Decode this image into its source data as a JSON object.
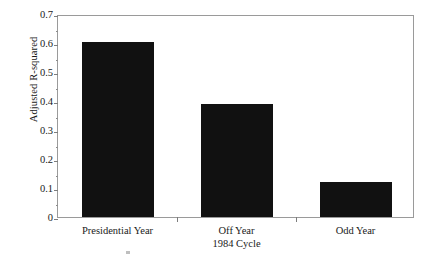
{
  "chart_data": {
    "type": "bar",
    "title": "",
    "subtitle": "",
    "xlabel": "1984 Cycle",
    "ylabel": "Adjusted R-squared",
    "categories": [
      "Presidential Year",
      "Off Year",
      "Odd Year"
    ],
    "category_sublabels": [
      "",
      "1984 Cycle",
      ""
    ],
    "values": [
      0.605,
      0.39,
      0.12
    ],
    "ylim": [
      0,
      0.7
    ],
    "ytick_labels": [
      "0",
      "0.1",
      "0.2",
      "0.3",
      "0.4",
      "0.5",
      "0.6",
      "0.7"
    ],
    "ytick_values": [
      0,
      0.1,
      0.2,
      0.3,
      0.4,
      0.5,
      0.6,
      0.7
    ],
    "grid": false,
    "legend": "none",
    "bar_color": "#111111",
    "frame_color": "#9a9a9a",
    "background": "#ffffff"
  },
  "axes": {
    "y_title": "Adjusted R-squared"
  }
}
